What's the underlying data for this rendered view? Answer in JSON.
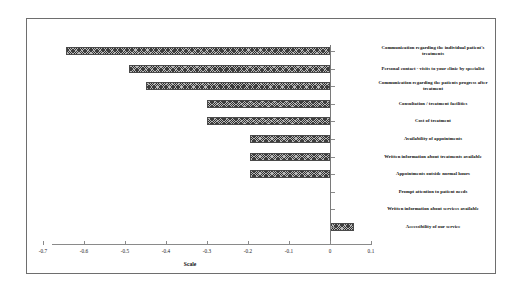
{
  "chart_data": {
    "type": "bar",
    "orientation": "horizontal",
    "title": "",
    "xlabel": "Scale",
    "ylabel": "",
    "xlim": [
      -0.7,
      0.1
    ],
    "grid": false,
    "legend": null,
    "xticks": [
      "-0.7",
      "-0.6",
      "-0.5",
      "-0.4",
      "-0.3",
      "-0.2",
      "-0.1",
      "0",
      "0.1"
    ],
    "xtick_values": [
      -0.7,
      -0.6,
      -0.5,
      -0.4,
      -0.3,
      -0.2,
      -0.1,
      0,
      0.1
    ],
    "categories": [
      "Communication regarding the individual patient's treatments",
      "Personal contact - visits to your clinic by specialist",
      "Communication regarding the patients progress after treatment",
      "Consultation / treatment facilities",
      "Cost of treatment",
      "Availability of appointments",
      "Written information about treatments available",
      "Appointments outside normal hours",
      "Prompt attention to patient needs",
      "Written information about services available",
      "Accessibility of our service"
    ],
    "values": [
      -0.645,
      -0.49,
      -0.45,
      -0.3,
      -0.3,
      -0.195,
      -0.195,
      -0.195,
      0.0,
      0.0,
      0.058
    ],
    "bar_fill": "#b9b9b9",
    "bar_edge": "#4a4a4a",
    "bar_pattern": "crosshatch"
  },
  "frame": {
    "border_color": "#6e6e6e"
  }
}
